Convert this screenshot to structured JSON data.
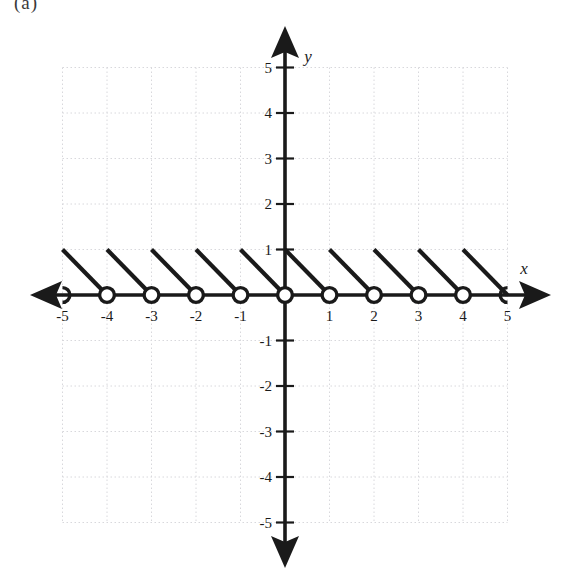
{
  "figure": {
    "partial_caption": "(a)",
    "background_color": "#ffffff",
    "ink_color": "#1a1a1a",
    "grid_color": "#d8d8dc"
  },
  "axes": {
    "x_label": "x",
    "y_label": "y",
    "origin_px": [
      285,
      295
    ],
    "unit_px_x": 44.5,
    "unit_px_y": 45.5,
    "x_tick_labels": [
      "-5",
      "-4",
      "-3",
      "-2",
      "-1",
      "1",
      "2",
      "3",
      "4",
      "5"
    ],
    "y_tick_labels": [
      "5",
      "4",
      "3",
      "2",
      "1",
      "-1",
      "-2",
      "-3",
      "-4",
      "-5"
    ],
    "x_ticks": [
      -5,
      -4,
      -3,
      -2,
      -1,
      1,
      2,
      3,
      4,
      5
    ],
    "y_ticks": [
      5,
      4,
      3,
      2,
      1,
      -1,
      -2,
      -3,
      -4,
      -5
    ],
    "arrows": [
      "left",
      "right",
      "up",
      "down"
    ]
  },
  "chart_data": {
    "type": "line",
    "title": "",
    "xlabel": "x",
    "ylabel": "y",
    "xlim": [
      -5.6,
      5.6
    ],
    "ylim": [
      -5.6,
      5.6
    ],
    "grid": true,
    "grid_style": "dotted",
    "legend": "none",
    "segments": [
      {
        "x_start": -5,
        "y_start": 1,
        "x_end": -4,
        "y_end": 0,
        "left_endpoint": "closed-implied",
        "right_endpoint": "open"
      },
      {
        "x_start": -4,
        "y_start": 1,
        "x_end": -3,
        "y_end": 0,
        "left_endpoint": "closed-implied",
        "right_endpoint": "open"
      },
      {
        "x_start": -3,
        "y_start": 1,
        "x_end": -2,
        "y_end": 0,
        "left_endpoint": "closed-implied",
        "right_endpoint": "open"
      },
      {
        "x_start": -2,
        "y_start": 1,
        "x_end": -1,
        "y_end": 0,
        "left_endpoint": "closed-implied",
        "right_endpoint": "open"
      },
      {
        "x_start": -1,
        "y_start": 1,
        "x_end": 0,
        "y_end": 0,
        "left_endpoint": "closed-implied",
        "right_endpoint": "open"
      },
      {
        "x_start": 0,
        "y_start": 1,
        "x_end": 1,
        "y_end": 0,
        "left_endpoint": "closed-implied",
        "right_endpoint": "open"
      },
      {
        "x_start": 1,
        "y_start": 1,
        "x_end": 2,
        "y_end": 0,
        "left_endpoint": "closed-implied",
        "right_endpoint": "open"
      },
      {
        "x_start": 2,
        "y_start": 1,
        "x_end": 3,
        "y_end": 0,
        "left_endpoint": "closed-implied",
        "right_endpoint": "open"
      },
      {
        "x_start": 3,
        "y_start": 1,
        "x_end": 4,
        "y_end": 0,
        "left_endpoint": "closed-implied",
        "right_endpoint": "open"
      },
      {
        "x_start": 4,
        "y_start": 1,
        "x_end": 5,
        "y_end": 0,
        "left_endpoint": "closed-implied",
        "right_endpoint": "open"
      }
    ],
    "open_circles": [
      {
        "x": -5,
        "y": 0,
        "clipped": "left-half-hidden"
      },
      {
        "x": -4,
        "y": 0
      },
      {
        "x": -3,
        "y": 0
      },
      {
        "x": -2,
        "y": 0
      },
      {
        "x": -1,
        "y": 0
      },
      {
        "x": 0,
        "y": 0
      },
      {
        "x": 1,
        "y": 0
      },
      {
        "x": 2,
        "y": 0
      },
      {
        "x": 3,
        "y": 0
      },
      {
        "x": 4,
        "y": 0
      },
      {
        "x": 5,
        "y": 0,
        "clipped": "right-half-hidden"
      }
    ]
  }
}
